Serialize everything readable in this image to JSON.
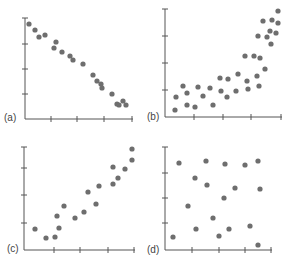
{
  "chart_data": [
    {
      "type": "scatter",
      "title": "(a)",
      "label": "(a)",
      "description": "Strong negative linear relationship",
      "xlabel": "",
      "ylabel": "",
      "grid": false,
      "frame": {
        "x0": 25,
        "y0": 119,
        "x1": 133,
        "ytop": 18,
        "yticks": [
          44,
          69,
          94
        ],
        "xticks": [
          51,
          77,
          104,
          132
        ],
        "label_pos": [
          4,
          112
        ]
      },
      "points": [
        [
          29,
          24
        ],
        [
          35,
          30
        ],
        [
          39,
          37
        ],
        [
          45,
          35
        ],
        [
          54,
          48
        ],
        [
          56,
          42
        ],
        [
          62,
          52
        ],
        [
          70,
          56
        ],
        [
          73,
          60
        ],
        [
          83,
          64
        ],
        [
          93,
          75
        ],
        [
          97,
          81
        ],
        [
          101,
          84
        ],
        [
          102,
          88
        ],
        [
          112,
          94
        ],
        [
          117,
          104
        ],
        [
          119,
          105
        ],
        [
          123,
          101
        ],
        [
          126,
          105
        ]
      ]
    },
    {
      "type": "scatter",
      "title": "(b)",
      "label": "(b)",
      "description": "Positive nonlinear (curved, increasing) relationship",
      "xlabel": "",
      "ylabel": "",
      "grid": false,
      "frame": {
        "x0": 165,
        "y0": 117,
        "x1": 282,
        "ytop": 9,
        "yticks": [
          36,
          63,
          90
        ],
        "xticks": [
          194,
          223,
          251,
          281
        ],
        "label_pos": [
          147,
          111
        ]
      },
      "points": [
        [
          278,
          11
        ],
        [
          263,
          21
        ],
        [
          272,
          20
        ],
        [
          278,
          23
        ],
        [
          270,
          31
        ],
        [
          258,
          36
        ],
        [
          267,
          37
        ],
        [
          276,
          33
        ],
        [
          271,
          44
        ],
        [
          245,
          56
        ],
        [
          254,
          56
        ],
        [
          260,
          58
        ],
        [
          265,
          69
        ],
        [
          238,
          74
        ],
        [
          257,
          76
        ],
        [
          220,
          78
        ],
        [
          228,
          79
        ],
        [
          247,
          81
        ],
        [
          183,
          86
        ],
        [
          198,
          87
        ],
        [
          210,
          88
        ],
        [
          259,
          86
        ],
        [
          187,
          93
        ],
        [
          221,
          91
        ],
        [
          236,
          91
        ],
        [
          248,
          89
        ],
        [
          203,
          96
        ],
        [
          227,
          97
        ],
        [
          176,
          97
        ],
        [
          187,
          105
        ],
        [
          195,
          107
        ],
        [
          213,
          105
        ],
        [
          175,
          110
        ]
      ]
    },
    {
      "type": "scatter",
      "title": "(c)",
      "label": "(c)",
      "description": "Moderate positive linear relationship",
      "xlabel": "",
      "ylabel": "",
      "grid": false,
      "frame": {
        "x0": 24,
        "y0": 250,
        "x1": 135,
        "ytop": 147,
        "yticks": [
          168,
          195,
          223
        ],
        "xticks": [
          54,
          80,
          108,
          134
        ],
        "label_pos": [
          7,
          243
        ]
      },
      "points": [
        [
          132,
          149
        ],
        [
          132,
          160
        ],
        [
          125,
          169
        ],
        [
          113,
          167
        ],
        [
          118,
          178
        ],
        [
          113,
          184
        ],
        [
          99,
          186
        ],
        [
          88,
          192
        ],
        [
          96,
          204
        ],
        [
          64,
          206
        ],
        [
          84,
          212
        ],
        [
          75,
          218
        ],
        [
          57,
          216
        ],
        [
          59,
          228
        ],
        [
          35,
          229
        ],
        [
          46,
          238
        ],
        [
          55,
          237
        ]
      ]
    },
    {
      "type": "scatter",
      "title": "(d)",
      "label": "(d)",
      "description": "No apparent relationship",
      "xlabel": "",
      "ylabel": "",
      "grid": false,
      "frame": {
        "x0": 165,
        "y0": 250,
        "x1": 272,
        "ytop": 147,
        "yticks": [
          173,
          198,
          223
        ],
        "xticks": [
          192,
          219,
          245,
          271
        ],
        "label_pos": [
          147,
          244
        ]
      },
      "points": [
        [
          179,
          163
        ],
        [
          206,
          161
        ],
        [
          225,
          164
        ],
        [
          245,
          165
        ],
        [
          258,
          161
        ],
        [
          195,
          178
        ],
        [
          207,
          185
        ],
        [
          235,
          188
        ],
        [
          260,
          189
        ],
        [
          224,
          198
        ],
        [
          188,
          206
        ],
        [
          213,
          218
        ],
        [
          196,
          229
        ],
        [
          229,
          229
        ],
        [
          250,
          226
        ],
        [
          173,
          237
        ],
        [
          219,
          236
        ],
        [
          258,
          245
        ]
      ]
    }
  ],
  "style": {
    "dot_color": "#6e6e6e",
    "axis_color": "#555555",
    "dot_radius": 2.6
  },
  "labels": {
    "a": "(a)",
    "b": "(b)",
    "c": "(c)",
    "d": "(d)"
  }
}
